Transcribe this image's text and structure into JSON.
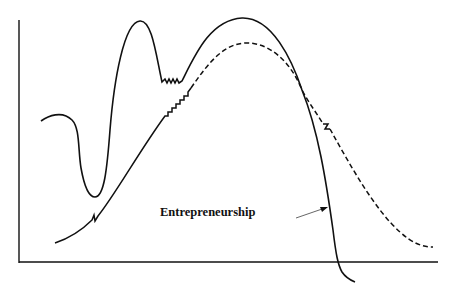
{
  "diagram": {
    "label": "Entrepreneurship",
    "colors": {
      "stroke": "#111111",
      "background": "#ffffff",
      "arrow": "#555555"
    },
    "curves": [
      {
        "name": "solid-curve",
        "style": "solid"
      },
      {
        "name": "dashed-curve",
        "style": "dashed"
      }
    ]
  }
}
